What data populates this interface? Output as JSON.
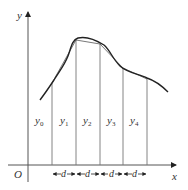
{
  "diagram": {
    "axes": {
      "x_label": "x",
      "y_label": "y",
      "origin_label": "O"
    },
    "ordinates": [
      {
        "name": "y",
        "sub": "0"
      },
      {
        "name": "y",
        "sub": "1"
      },
      {
        "name": "y",
        "sub": "2"
      },
      {
        "name": "y",
        "sub": "3"
      },
      {
        "name": "y",
        "sub": "4"
      }
    ],
    "intervals": [
      {
        "label": "d"
      },
      {
        "label": "d"
      },
      {
        "label": "d"
      },
      {
        "label": "d"
      }
    ],
    "colors": {
      "line": "#333333",
      "ordinate": "#666666",
      "curve": "#222222"
    }
  }
}
